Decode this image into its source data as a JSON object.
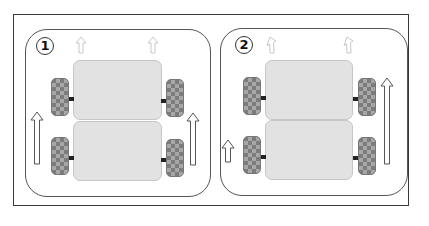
{
  "diagram": {
    "type": "vehicle-steering-comparison",
    "colors": {
      "frame_border": "#3a3a3a",
      "panel_border": "#555555",
      "body_fill": "#e2e2e2",
      "wheel_dark": "#7c7c7c",
      "wheel_light": "#a7a7a7",
      "axle": "#222222",
      "arrow_stroke_strong": "#555555",
      "arrow_stroke_faint": "#c8c8c8"
    },
    "panels": [
      {
        "label": "1",
        "description": "Both sides driven equally - straight motion",
        "top_arrows": [
          "straight-faint",
          "straight-faint"
        ],
        "side_arrows": [
          {
            "side": "left",
            "length": "medium"
          },
          {
            "side": "right",
            "length": "medium"
          }
        ]
      },
      {
        "label": "2",
        "description": "Right side faster than left - turning left",
        "top_arrows": [
          "turn-left-faint",
          "turn-left-faint"
        ],
        "side_arrows": [
          {
            "side": "left",
            "length": "short"
          },
          {
            "side": "right",
            "length": "long"
          }
        ]
      }
    ]
  }
}
